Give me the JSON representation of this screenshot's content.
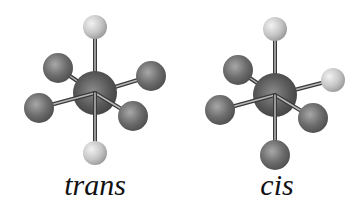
{
  "diagram": {
    "type": "octahedral-isomers",
    "molecules": [
      {
        "name": "trans",
        "label": "trans",
        "center": {
          "x": 95,
          "y": 93,
          "r": 22,
          "color": "#5a5a5a"
        },
        "ligands": [
          {
            "pos": "top",
            "x": 95,
            "y": 27,
            "r": 12,
            "kind": "light"
          },
          {
            "pos": "upper-left",
            "x": 58,
            "y": 68,
            "r": 15,
            "kind": "dark"
          },
          {
            "pos": "right",
            "x": 151,
            "y": 76,
            "r": 15,
            "kind": "dark"
          },
          {
            "pos": "left",
            "x": 39,
            "y": 108,
            "r": 15,
            "kind": "dark"
          },
          {
            "pos": "lower-right",
            "x": 133,
            "y": 116,
            "r": 15,
            "kind": "dark"
          },
          {
            "pos": "bottom",
            "x": 95,
            "y": 153,
            "r": 12,
            "kind": "light"
          }
        ],
        "label_pos": {
          "x": 95,
          "y": 168
        }
      },
      {
        "name": "cis",
        "label": "cis",
        "center": {
          "x": 275,
          "y": 95,
          "r": 22,
          "color": "#5a5a5a"
        },
        "ligands": [
          {
            "pos": "top",
            "x": 275,
            "y": 29,
            "r": 12,
            "kind": "light"
          },
          {
            "pos": "upper-left",
            "x": 238,
            "y": 70,
            "r": 15,
            "kind": "dark"
          },
          {
            "pos": "right",
            "x": 333,
            "y": 80,
            "r": 12,
            "kind": "light"
          },
          {
            "pos": "left",
            "x": 220,
            "y": 110,
            "r": 15,
            "kind": "dark"
          },
          {
            "pos": "lower-right",
            "x": 313,
            "y": 118,
            "r": 15,
            "kind": "dark"
          },
          {
            "pos": "bottom",
            "x": 275,
            "y": 155,
            "r": 15,
            "kind": "dark"
          }
        ],
        "label_pos": {
          "x": 277,
          "y": 168
        }
      }
    ],
    "colors": {
      "light_atom": "#c8c8c8",
      "dark_atom": "#6e6e6e",
      "center_atom": "#555555",
      "bond": "#3a3a3a",
      "bond_highlight": "#d8d8d8"
    }
  }
}
